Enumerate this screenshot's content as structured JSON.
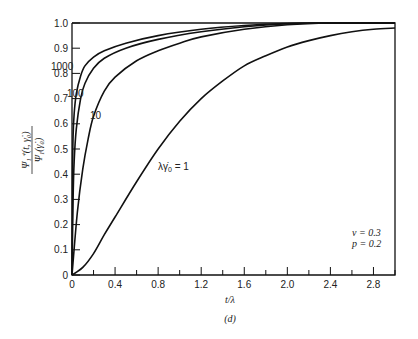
{
  "chart_data": {
    "type": "line",
    "title": "",
    "panel_label": "(d)",
    "xlabel": "t/λ",
    "ylabel": "Ψ1+(t, γ̇0) / Ψ1(γ̇0)",
    "xlim": [
      0,
      3.0
    ],
    "ylim": [
      0,
      1.0
    ],
    "xticks": [
      "0",
      "0.4",
      "0.8",
      "1.2",
      "1.6",
      "2.0",
      "2.4",
      "2.8"
    ],
    "yticks": [
      "0",
      "0.1",
      "0.2",
      "0.3",
      "0.4",
      "0.5",
      "0.6",
      "0.7",
      "0.8",
      "0.9",
      "1.0"
    ],
    "grid": false,
    "annotations": [
      "ν = 0.3",
      "p = 0.2"
    ],
    "series": [
      {
        "name": "1000",
        "x": [
          0,
          0.005,
          0.01,
          0.02,
          0.04,
          0.08,
          0.12,
          0.2,
          0.3,
          0.5,
          0.8,
          1.2,
          1.6,
          2.0,
          2.4,
          3.0
        ],
        "values": [
          0,
          0.4,
          0.55,
          0.64,
          0.72,
          0.79,
          0.83,
          0.865,
          0.89,
          0.92,
          0.95,
          0.975,
          0.99,
          0.998,
          1.0,
          1.0
        ]
      },
      {
        "name": "100",
        "x": [
          0,
          0.01,
          0.02,
          0.04,
          0.08,
          0.12,
          0.2,
          0.3,
          0.5,
          0.8,
          1.2,
          1.6,
          2.0,
          2.4,
          3.0
        ],
        "values": [
          0,
          0.3,
          0.45,
          0.58,
          0.7,
          0.76,
          0.82,
          0.86,
          0.9,
          0.935,
          0.965,
          0.985,
          0.997,
          1.0,
          1.0
        ]
      },
      {
        "name": "10",
        "x": [
          0,
          0.05,
          0.1,
          0.15,
          0.2,
          0.3,
          0.4,
          0.6,
          0.8,
          1.0,
          1.2,
          1.6,
          2.0,
          2.4,
          3.0
        ],
        "values": [
          0,
          0.25,
          0.42,
          0.54,
          0.63,
          0.73,
          0.785,
          0.85,
          0.89,
          0.92,
          0.945,
          0.975,
          0.993,
          1.0,
          1.0
        ]
      },
      {
        "name": "λγ̇0 = 1",
        "x": [
          0,
          0.1,
          0.2,
          0.3,
          0.4,
          0.6,
          0.8,
          1.0,
          1.2,
          1.4,
          1.6,
          1.8,
          2.0,
          2.2,
          2.4,
          2.6,
          2.8,
          3.0
        ],
        "values": [
          0,
          0.03,
          0.085,
          0.16,
          0.23,
          0.37,
          0.5,
          0.61,
          0.7,
          0.77,
          0.83,
          0.87,
          0.905,
          0.93,
          0.95,
          0.965,
          0.975,
          0.98
        ]
      }
    ]
  },
  "labels": {
    "curve_1000": "1000",
    "curve_100": "100",
    "curve_10": "10",
    "curve_1_prefix": "λγ̇",
    "curve_1_sub": "0",
    "curve_1_suffix": " = 1",
    "nu": "ν = 0.3",
    "p": "p = 0.2",
    "xlabel": "t/λ",
    "panel": "(d)"
  }
}
